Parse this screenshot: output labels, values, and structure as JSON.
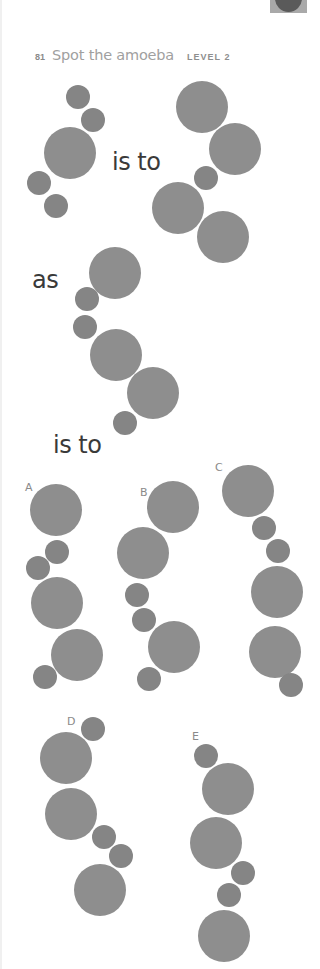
{
  "page": {
    "background": "#ffffff",
    "circle_color_large": "#8e8e8e",
    "circle_color_small": "#858585"
  },
  "header": {
    "puzzle_number": "81",
    "title": "Spot the amoeba",
    "level": "LEVEL 2"
  },
  "corner_tab": {
    "icon": "circle-tab-icon"
  },
  "connectors": {
    "is_to_1": "is to",
    "as": "as",
    "is_to_2": "is to"
  },
  "option_labels": [
    "A",
    "B",
    "C",
    "D",
    "E"
  ],
  "figures": {
    "first": {
      "circles": [
        {
          "x": 78,
          "y": 97,
          "size": "small"
        },
        {
          "x": 93,
          "y": 120,
          "size": "small"
        },
        {
          "x": 70,
          "y": 153,
          "size": "large"
        },
        {
          "x": 39,
          "y": 183,
          "size": "small"
        },
        {
          "x": 56,
          "y": 206,
          "size": "small"
        }
      ]
    },
    "second": {
      "circles": [
        {
          "x": 202,
          "y": 107,
          "size": "large"
        },
        {
          "x": 235,
          "y": 149,
          "size": "large"
        },
        {
          "x": 206,
          "y": 178,
          "size": "small"
        },
        {
          "x": 178,
          "y": 208,
          "size": "large"
        },
        {
          "x": 223,
          "y": 237,
          "size": "large"
        }
      ]
    },
    "third": {
      "circles": [
        {
          "x": 115,
          "y": 273,
          "size": "large"
        },
        {
          "x": 87,
          "y": 299,
          "size": "small"
        },
        {
          "x": 85,
          "y": 327,
          "size": "small"
        },
        {
          "x": 116,
          "y": 355,
          "size": "large"
        },
        {
          "x": 153,
          "y": 393,
          "size": "large"
        },
        {
          "x": 125,
          "y": 423,
          "size": "small"
        }
      ]
    },
    "option_a": {
      "circles": [
        {
          "x": 56,
          "y": 510,
          "size": "large"
        },
        {
          "x": 57,
          "y": 552,
          "size": "small"
        },
        {
          "x": 38,
          "y": 568,
          "size": "small"
        },
        {
          "x": 57,
          "y": 603,
          "size": "large"
        },
        {
          "x": 77,
          "y": 655,
          "size": "large"
        },
        {
          "x": 45,
          "y": 677,
          "size": "small"
        }
      ]
    },
    "option_b": {
      "circles": [
        {
          "x": 173,
          "y": 507,
          "size": "large"
        },
        {
          "x": 143,
          "y": 553,
          "size": "large"
        },
        {
          "x": 137,
          "y": 595,
          "size": "small"
        },
        {
          "x": 144,
          "y": 620,
          "size": "small"
        },
        {
          "x": 174,
          "y": 647,
          "size": "large"
        },
        {
          "x": 149,
          "y": 679,
          "size": "small"
        }
      ]
    },
    "option_c": {
      "circles": [
        {
          "x": 248,
          "y": 491,
          "size": "large"
        },
        {
          "x": 264,
          "y": 528,
          "size": "small"
        },
        {
          "x": 278,
          "y": 551,
          "size": "small"
        },
        {
          "x": 277,
          "y": 592,
          "size": "large"
        },
        {
          "x": 275,
          "y": 652,
          "size": "large"
        },
        {
          "x": 291,
          "y": 685,
          "size": "small"
        }
      ]
    },
    "option_d": {
      "circles": [
        {
          "x": 93,
          "y": 729,
          "size": "small"
        },
        {
          "x": 66,
          "y": 758,
          "size": "large"
        },
        {
          "x": 71,
          "y": 814,
          "size": "large"
        },
        {
          "x": 104,
          "y": 837,
          "size": "small"
        },
        {
          "x": 121,
          "y": 856,
          "size": "small"
        },
        {
          "x": 100,
          "y": 890,
          "size": "large"
        }
      ]
    },
    "option_e": {
      "circles": [
        {
          "x": 206,
          "y": 756,
          "size": "small"
        },
        {
          "x": 228,
          "y": 789,
          "size": "large"
        },
        {
          "x": 216,
          "y": 843,
          "size": "large"
        },
        {
          "x": 243,
          "y": 873,
          "size": "small"
        },
        {
          "x": 229,
          "y": 895,
          "size": "small"
        },
        {
          "x": 224,
          "y": 936,
          "size": "large"
        }
      ]
    }
  }
}
